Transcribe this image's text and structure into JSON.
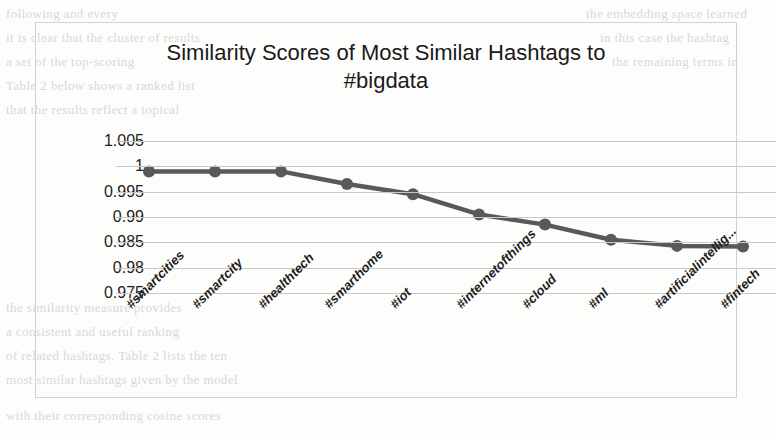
{
  "chart": {
    "title_line1": "Similarity Scores of Most Similar Hashtags to",
    "title_line2": "#bigdata",
    "series_color": "#595959"
  },
  "chart_data": {
    "type": "line",
    "title": "Similarity Scores of Most Similar Hashtags to #bigdata",
    "xlabel": "",
    "ylabel": "",
    "ylim": [
      0.975,
      1.005
    ],
    "yticks": [
      "1.005",
      "1",
      "0.995",
      "0.99",
      "0.985",
      "0.98",
      "0.975"
    ],
    "ytick_values": [
      1.005,
      1.0,
      0.995,
      0.99,
      0.985,
      0.98,
      0.975
    ],
    "grid": true,
    "legend": "none",
    "categories": [
      "#smartcities",
      "#smartcity",
      "#healthtech",
      "#smarthome",
      "#iot",
      "#internetofthings",
      "#cloud",
      "#ml",
      "#artificialintellig...",
      "#fintech"
    ],
    "values": [
      0.999,
      0.999,
      0.999,
      0.9965,
      0.9945,
      0.9905,
      0.9885,
      0.9855,
      0.9843,
      0.9842
    ],
    "series": [
      {
        "name": "similarity",
        "values": [
          0.999,
          0.999,
          0.999,
          0.9965,
          0.9945,
          0.9905,
          0.9885,
          0.9855,
          0.9843,
          0.9842
        ]
      }
    ]
  },
  "background_text": {
    "lines": [
      "following and every",
      "it is clear that the cluster of results",
      "a set of the top-scoring",
      "Table 2 below shows a ranked list",
      "that the results reflect a topical",
      "the embedding space learned",
      "in this case the hashtag",
      "the remaining terms in",
      "the similarity measure provides",
      "a consistent and useful ranking",
      "of related hashtags. Table 2 lists the ten",
      "most similar hashtags given by the model",
      "with their corresponding cosine scores"
    ]
  }
}
